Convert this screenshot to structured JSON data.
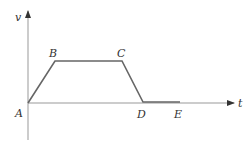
{
  "axes": {
    "y_label": "v",
    "x_label": "t"
  },
  "points": [
    {
      "label": "A",
      "x": 28,
      "y": 103
    },
    {
      "label": "B",
      "x": 55,
      "y": 61
    },
    {
      "label": "C",
      "x": 122,
      "y": 61
    },
    {
      "label": "D",
      "x": 143,
      "y": 102
    },
    {
      "label": "E",
      "x": 180,
      "y": 102
    }
  ],
  "colors": {
    "axis": "#888888",
    "curve": "#666666"
  }
}
